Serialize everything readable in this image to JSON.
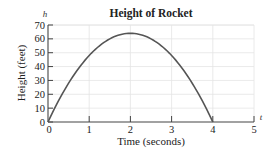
{
  "chart_data": {
    "type": "line",
    "title": "Height of Rocket",
    "xlabel": "Time (seconds)",
    "ylabel": "Height (feet)",
    "x_axis_variable": "t",
    "y_axis_variable": "h",
    "xlim": [
      0,
      5
    ],
    "ylim": [
      0,
      70
    ],
    "x_ticks": [
      "0",
      "1",
      "2",
      "3",
      "4",
      "5"
    ],
    "y_ticks": [
      "0",
      "10",
      "20",
      "30",
      "40",
      "50",
      "60",
      "70"
    ],
    "grid": true,
    "legend": null,
    "series": [
      {
        "name": "h = 64t - 16t^2",
        "x": [
          0,
          0.5,
          1,
          1.5,
          2,
          2.5,
          3,
          3.5,
          4
        ],
        "values": [
          0,
          28,
          48,
          60,
          64,
          60,
          48,
          28,
          0
        ]
      }
    ],
    "colors": {
      "curve": "#555555",
      "axis": "#444444",
      "grid": "#e4e4e4",
      "text": "#222222"
    }
  }
}
